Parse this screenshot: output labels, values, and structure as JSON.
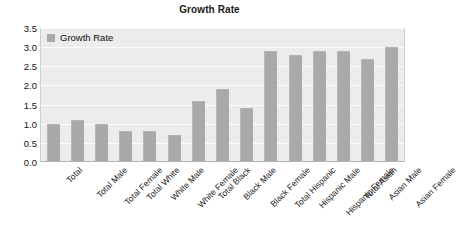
{
  "chart_data": {
    "type": "bar",
    "title": "Growth Rate",
    "xlabel": "",
    "ylabel": "",
    "ylim": [
      0,
      3.5
    ],
    "ytick_labels": [
      "3.5",
      "3.0",
      "2.5",
      "2.0",
      "1.5",
      "1.0",
      "0.5",
      "0.0"
    ],
    "ytick_values": [
      3.5,
      3.0,
      2.5,
      2.0,
      1.5,
      1.0,
      0.5,
      0.0
    ],
    "grid": true,
    "legend_position": "top-left",
    "legend": [
      "Growth Rate"
    ],
    "categories": [
      "Total",
      "Total Male",
      "Total Female",
      "Total White",
      "White Male",
      "White Female",
      "Total Black",
      "Black Male",
      "Black Female",
      "Total Hispanic",
      "Hispanic Male",
      "Hispanic Female",
      "Total Asian",
      "Asian Male",
      "Asian Female"
    ],
    "series": [
      {
        "name": "Growth Rate",
        "color": "#a9a9a9",
        "values": [
          1.0,
          1.1,
          1.0,
          0.8,
          0.8,
          0.7,
          1.6,
          1.9,
          1.4,
          2.9,
          2.8,
          2.9,
          2.9,
          2.7,
          3.0
        ]
      }
    ]
  },
  "colors": {
    "bar": "#a9a9a9",
    "plot_background": "#ececec",
    "gridline": "#fdfdfd",
    "page_background": "#ffffff",
    "text": "#111111"
  }
}
